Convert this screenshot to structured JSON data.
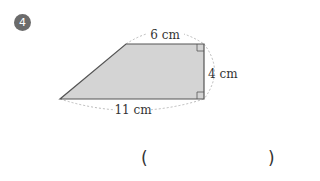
{
  "problem": {
    "number": "4",
    "figure": {
      "shape": "right trapezoid",
      "fill_color": "#d4d4d4",
      "stroke_color": "#555555",
      "labels": {
        "top": "6 cm",
        "right": "4 cm",
        "bottom": "11 cm"
      }
    },
    "answer": {
      "open_paren": "(",
      "close_paren": ")",
      "value": ""
    }
  }
}
